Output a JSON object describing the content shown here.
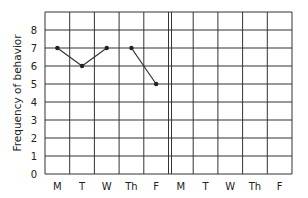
{
  "chart_data": {
    "type": "line",
    "title": "",
    "xlabel": "",
    "ylabel": "Frequency of behavior",
    "ylim": [
      0,
      9
    ],
    "yticks": [
      0,
      1,
      2,
      3,
      4,
      5,
      6,
      7,
      8
    ],
    "grid": true,
    "legend": null,
    "categories": [
      "M",
      "T",
      "W",
      "Th",
      "F",
      "M",
      "T",
      "W",
      "Th",
      "F"
    ],
    "phase_divider_after_index": 4,
    "series": [
      {
        "name": "Week 1",
        "values": [
          7,
          6,
          7,
          7,
          5,
          null,
          null,
          null,
          null,
          null
        ],
        "segments": [
          [
            0,
            2
          ],
          [
            3,
            4
          ]
        ]
      }
    ]
  }
}
